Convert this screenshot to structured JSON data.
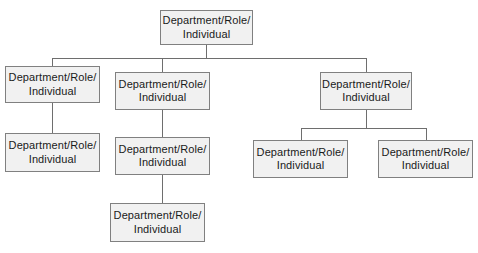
{
  "diagram": {
    "type": "org-chart",
    "background_color": "#ffffff",
    "node_fill_color": "#f1f1f1",
    "node_border_color": "#808080",
    "connector_color": "#6e6e6e",
    "text_color": "#1a1a1a",
    "node_label": "Department/Role/\nIndividual",
    "nodes": [
      {
        "id": "root",
        "label": "Department/Role/\nIndividual",
        "level": 1
      },
      {
        "id": "branch-1",
        "label": "Department/Role/\nIndividual",
        "level": 2
      },
      {
        "id": "branch-2",
        "label": "Department/Role/\nIndividual",
        "level": 2
      },
      {
        "id": "branch-3",
        "label": "Department/Role/\nIndividual",
        "level": 2
      },
      {
        "id": "child-1-1",
        "label": "Department/Role/\nIndividual",
        "level": 3
      },
      {
        "id": "child-2-1",
        "label": "Department/Role/\nIndividual",
        "level": 3
      },
      {
        "id": "child-3-1",
        "label": "Department/Role/\nIndividual",
        "level": 3
      },
      {
        "id": "child-3-2",
        "label": "Department/Role/\nIndividual",
        "level": 3
      },
      {
        "id": "child-2-1-1",
        "label": "Department/Role/\nIndividual",
        "level": 4
      }
    ]
  }
}
